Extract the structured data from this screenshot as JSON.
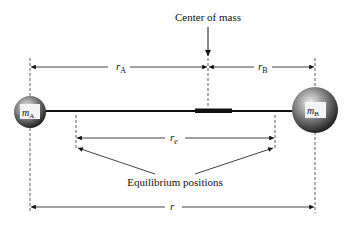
{
  "diagram": {
    "title_label": "Center of mass",
    "labels": {
      "r_A": {
        "base": "r",
        "sub": "A"
      },
      "r_B": {
        "base": "r",
        "sub": "B"
      },
      "r_e": {
        "base": "r",
        "sub": "e"
      },
      "r": {
        "base": "r"
      }
    },
    "masses": [
      {
        "id": "A",
        "base": "m",
        "sub": "A"
      },
      {
        "id": "B",
        "base": "m",
        "sub": "B"
      }
    ],
    "equilibrium_label": "Equilibrium positions",
    "colors": {
      "line": "#111111",
      "dashed": "#333333",
      "sphere_light": "#e8e8e8",
      "sphere_dark": "#1a1a1a"
    }
  }
}
